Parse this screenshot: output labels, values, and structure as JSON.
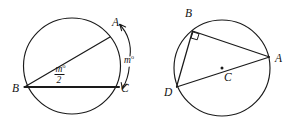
{
  "figure": {
    "caption_present": false,
    "background_color": "#ffffff",
    "ink_color": "#1a1a1a",
    "width": 298,
    "height": 134,
    "panels": [
      {
        "id": "left-panel",
        "name": "inscribed-angle-diagram",
        "circle": {
          "cx": 72,
          "cy": 66,
          "r": 48
        },
        "points": [
          {
            "key": "A",
            "label": "A",
            "x": 110,
            "y": 37,
            "label_x": 112,
            "label_y": 26
          },
          {
            "key": "B",
            "label": "B",
            "x": 24.5,
            "y": 87,
            "label_x": 12,
            "label_y": 92
          },
          {
            "key": "C",
            "label": "C",
            "x": 119,
            "y": 87,
            "label_x": 121,
            "label_y": 92
          }
        ],
        "segments": [
          {
            "from": "B",
            "to": "A",
            "weight": "normal"
          },
          {
            "from": "B",
            "to": "C",
            "weight": "heavy"
          }
        ],
        "annotations": [
          {
            "kind": "fraction",
            "name": "inscribed-angle-measure",
            "numerator": "m",
            "numerator_superscript": "o",
            "denominator": "2",
            "x": 62,
            "y": 74
          },
          {
            "kind": "arc-arrow",
            "name": "intercepted-arc-measure",
            "label": "m",
            "label_superscript": "o",
            "label_x": 128,
            "label_y": 60,
            "double_headed": true
          }
        ]
      },
      {
        "id": "right-panel",
        "name": "thales-right-angle-diagram",
        "circle": {
          "cx": 222,
          "cy": 68,
          "r": 48
        },
        "points": [
          {
            "key": "B",
            "label": "B",
            "x": 192,
            "y": 31,
            "label_x": 186,
            "label_y": 17
          },
          {
            "key": "A",
            "label": "A",
            "x": 269.5,
            "y": 57,
            "label_x": 275,
            "label_y": 62
          },
          {
            "key": "D",
            "label": "D",
            "x": 176,
            "y": 87,
            "label_x": 164,
            "label_y": 95
          },
          {
            "key": "C",
            "label": "C",
            "x": 222,
            "y": 68,
            "label_x": 224,
            "label_y": 80,
            "is_center": true
          }
        ],
        "segments": [
          {
            "from": "B",
            "to": "A",
            "weight": "normal"
          },
          {
            "from": "B",
            "to": "D",
            "weight": "normal"
          },
          {
            "from": "D",
            "to": "A",
            "weight": "normal"
          }
        ],
        "annotations": [
          {
            "kind": "right-angle-square",
            "name": "right-angle-mark-at-b",
            "at": "B",
            "size": 7
          },
          {
            "kind": "center-dot",
            "name": "circle-center-dot",
            "at": "C"
          }
        ]
      }
    ]
  }
}
